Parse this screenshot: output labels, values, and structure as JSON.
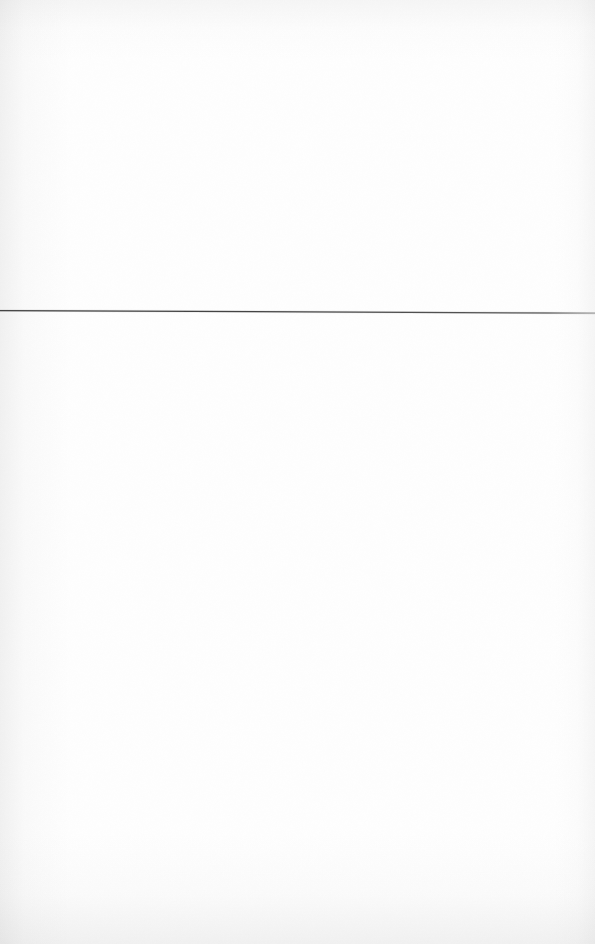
{
  "page": {
    "kind": "scanned-blank-page",
    "width": 595,
    "height": 944,
    "background_color": "#fefefe",
    "text_content": "",
    "visible_text_elements": []
  },
  "marks": {
    "horizontal_rule": {
      "label": "",
      "color": "#3a3a3a",
      "x_start": 0,
      "x_end": 595,
      "y_left": 310,
      "y_right": 313,
      "thickness": 1
    }
  },
  "scan_artifacts": {
    "left_edge_shadow": "#969696",
    "right_edge_shadow": "#a0a0a0",
    "top_edge_shadow": "#aaaaaa",
    "bottom_edge_shadow": "#a0a0a0"
  }
}
